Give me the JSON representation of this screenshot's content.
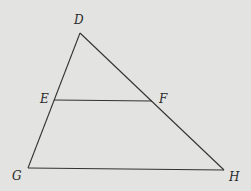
{
  "diagram": {
    "type": "triangle-with-midsegment",
    "background": "#e3e3e1",
    "stroke": "#333333",
    "points": {
      "D": {
        "label": "D",
        "x": 80,
        "y": 33,
        "label_x": 74,
        "label_y": 14
      },
      "E": {
        "label": "E",
        "x": 54,
        "y": 100,
        "label_x": 40,
        "label_y": 93
      },
      "F": {
        "label": "F",
        "x": 152,
        "y": 101,
        "label_x": 159,
        "label_y": 93
      },
      "G": {
        "label": "G",
        "x": 28,
        "y": 168,
        "label_x": 12,
        "label_y": 170
      },
      "H": {
        "label": "H",
        "x": 224,
        "y": 170,
        "label_x": 229,
        "label_y": 171
      }
    },
    "segments": [
      {
        "from": "D",
        "to": "G"
      },
      {
        "from": "D",
        "to": "H"
      },
      {
        "from": "G",
        "to": "H"
      },
      {
        "from": "E",
        "to": "F"
      }
    ]
  }
}
